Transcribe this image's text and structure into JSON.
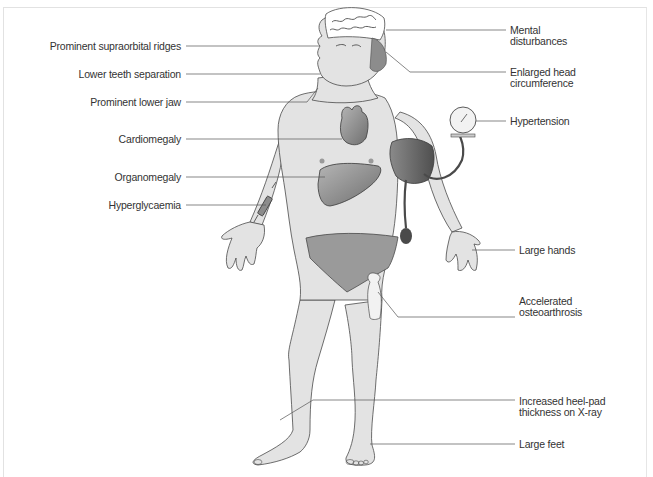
{
  "figure": {
    "colors": {
      "skin": "#e3e3e3",
      "outline": "#4a4a4a",
      "organ": "#8c8c8c",
      "cuff": "#6e6e6e",
      "underwear": "#9a9a9a",
      "leader_line": "#555555",
      "text": "#333333"
    }
  },
  "labels": {
    "left": [
      {
        "id": "supraorbital",
        "text": "Prominent supraorbital ridges"
      },
      {
        "id": "teeth",
        "text": "Lower teeth separation"
      },
      {
        "id": "jaw",
        "text": "Prominent lower jaw"
      },
      {
        "id": "cardiomegaly",
        "text": "Cardiomegaly"
      },
      {
        "id": "organomegaly",
        "text": "Organomegaly"
      },
      {
        "id": "hyperglycaemia",
        "text": "Hyperglycaemia"
      }
    ],
    "right": [
      {
        "id": "mental",
        "line1": "Mental",
        "line2": "disturbances"
      },
      {
        "id": "head",
        "line1": "Enlarged head",
        "line2": "circumference"
      },
      {
        "id": "hypertension",
        "line1": "Hypertension",
        "line2": ""
      },
      {
        "id": "hands",
        "line1": "Large hands",
        "line2": ""
      },
      {
        "id": "osteoarthrosis",
        "line1": "Accelerated",
        "line2": "osteoarthrosis"
      },
      {
        "id": "heelpad",
        "line1": "Increased heel-pad",
        "line2": "thickness on X-ray"
      },
      {
        "id": "feet",
        "line1": "Large feet",
        "line2": ""
      }
    ]
  }
}
